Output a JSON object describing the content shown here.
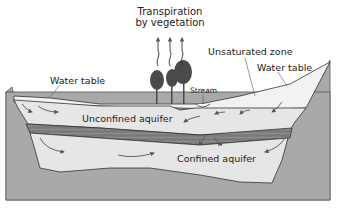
{
  "diagram": {
    "labels": {
      "transpiration_line1": "Transpiration",
      "transpiration_line2": "by vegetation",
      "water_table_left": "Water table",
      "unsaturated_zone": "Unsaturated zone",
      "water_table_right": "Water table",
      "stream": "Stream",
      "unconfined_aquifer": "Unconfined aquifer",
      "confined_aquifer": "Confined aquifer"
    },
    "colors": {
      "bedrock": "#a9a9a9",
      "aquifer": "#e6e6e6",
      "unsaturated": "#f2f2f2",
      "confining_layer": "#6f6f6f",
      "outline": "#333333",
      "tree": "#4a4a4a",
      "arrow": "#555555"
    }
  }
}
